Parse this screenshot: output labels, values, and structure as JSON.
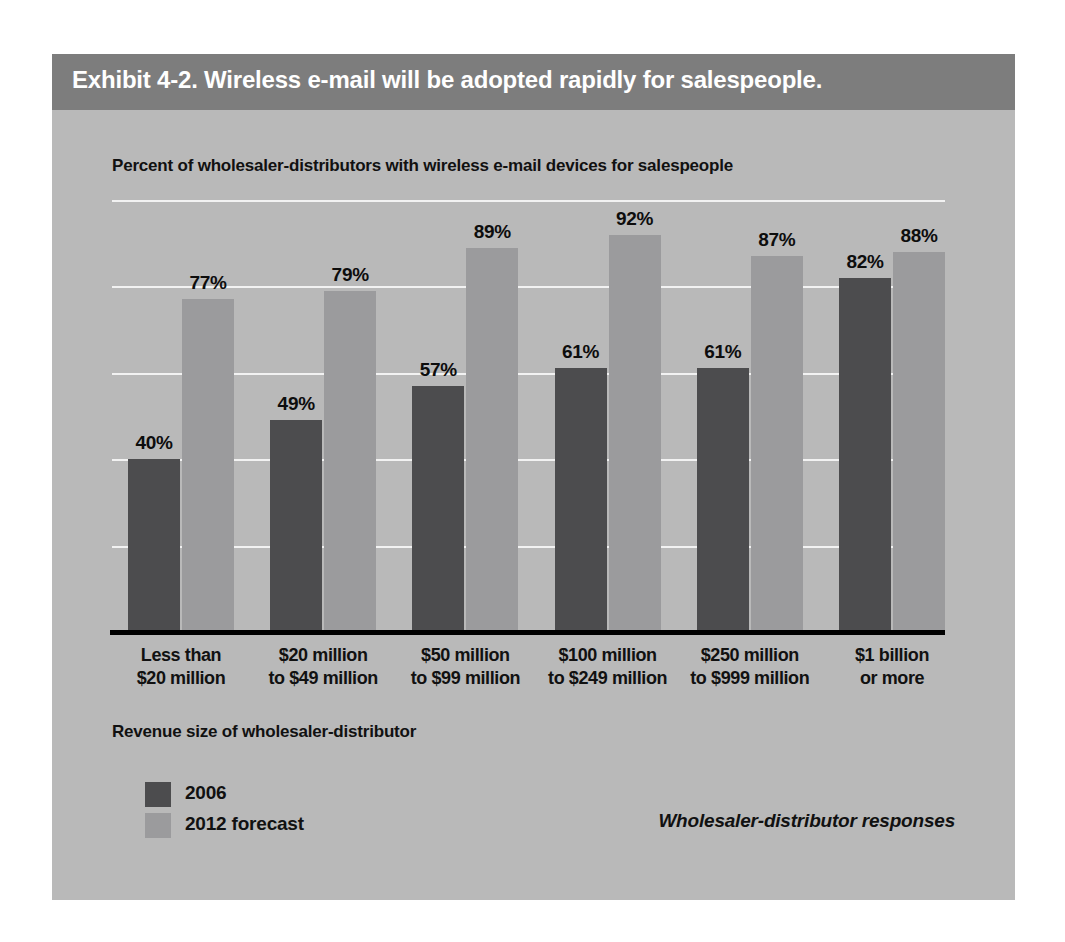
{
  "exhibit": {
    "title": "Exhibit 4-2. Wireless e-mail will be adopted rapidly for salespeople.",
    "subtitle": "Percent of wholesaler-distributors with wireless e-mail devices for salespeople",
    "axis_title": "Revenue size of wholesaler-distributor",
    "source_note": "Wholesaler-distributor responses"
  },
  "colors": {
    "title_band": "#7d7d7d",
    "panel": "#b9b9b9",
    "series_2006": "#4c4c4e",
    "series_2012": "#9b9b9d",
    "gridline": "#f2f2f2",
    "axis": "#000000",
    "text": "#111111",
    "title_text": "#ffffff"
  },
  "legend": {
    "items": [
      {
        "label": "2006",
        "color": "#4c4c4e"
      },
      {
        "label": "2012 forecast",
        "color": "#9b9b9d"
      }
    ]
  },
  "chart_data": {
    "type": "bar",
    "title": "Exhibit 4-2. Wireless e-mail will be adopted rapidly for salespeople.",
    "subtitle": "Percent of wholesaler-distributors with wireless e-mail devices for salespeople",
    "xlabel": "Revenue size of wholesaler-distributor",
    "ylabel": "Percent of wholesaler-distributors with wireless e-mail devices for salespeople",
    "ylim": [
      0,
      100
    ],
    "grid": true,
    "gridline_values": [
      20,
      40,
      60,
      80,
      100
    ],
    "y_axis_labels_shown": false,
    "legend_position": "bottom-left",
    "value_suffix": "%",
    "categories": [
      "Less than\n$20 million",
      "$20 million\nto $49 million",
      "$50 million\nto $99 million",
      "$100 million\nto $249 million",
      "$250 million\nto $999 million",
      "$1 billion\nor more"
    ],
    "category_lines": [
      [
        "Less than",
        "$20 million"
      ],
      [
        "$20 million",
        "to $49 million"
      ],
      [
        "$50 million",
        "to $99 million"
      ],
      [
        "$100 million",
        "to $249 million"
      ],
      [
        "$250 million",
        "to $999 million"
      ],
      [
        "$1 billion",
        "or more"
      ]
    ],
    "series": [
      {
        "name": "2006",
        "color": "#4c4c4e",
        "values": [
          40,
          49,
          57,
          61,
          61,
          82
        ],
        "labels": [
          "40%",
          "49%",
          "57%",
          "61%",
          "61%",
          "82%"
        ]
      },
      {
        "name": "2012 forecast",
        "color": "#9b9b9d",
        "values": [
          77,
          79,
          89,
          92,
          87,
          88
        ],
        "labels": [
          "77%",
          "79%",
          "89%",
          "92%",
          "87%",
          "88%"
        ]
      }
    ]
  }
}
